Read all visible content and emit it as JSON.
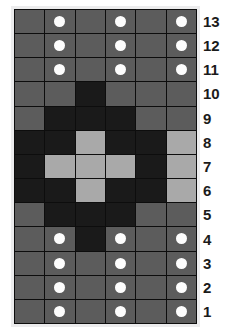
{
  "chart": {
    "columns": 6,
    "rows": 13,
    "colors": {
      "medium": "#5c5c5c",
      "dark": "#1a1a1a",
      "light": "#a9a9a9",
      "dot": "#fdfdfd",
      "gridline": "#0d0d0d",
      "frame": "#ececed",
      "label_text": "#1b1b1b",
      "background": "#ffffff"
    },
    "row_labels": [
      "13",
      "12",
      "11",
      "10",
      "9",
      "8",
      "7",
      "6",
      "5",
      "4",
      "3",
      "2",
      "1"
    ],
    "legend_symbols": {
      "dot": "white-dot",
      "medium": "medium-grey-square",
      "dark": "dark-square",
      "light": "light-grey-square"
    }
  },
  "chart_data": {
    "type": "heatmap",
    "xlabel": "",
    "ylabel": "",
    "categories": [
      "1",
      "2",
      "3",
      "4",
      "5",
      "6"
    ],
    "row_order_top_to_bottom": [
      "13",
      "12",
      "11",
      "10",
      "9",
      "8",
      "7",
      "6",
      "5",
      "4",
      "3",
      "2",
      "1"
    ],
    "value_legend": {
      "medium": "medium grey cell",
      "dark": "dark cell",
      "light": "light grey cell"
    },
    "grid": true,
    "legend_position": "none",
    "cells": [
      {
        "row": "13",
        "values": [
          "medium",
          "medium",
          "medium",
          "medium",
          "medium",
          "medium"
        ],
        "dots": [
          false,
          true,
          false,
          true,
          false,
          true
        ]
      },
      {
        "row": "12",
        "values": [
          "medium",
          "medium",
          "medium",
          "medium",
          "medium",
          "medium"
        ],
        "dots": [
          false,
          true,
          false,
          true,
          false,
          true
        ]
      },
      {
        "row": "11",
        "values": [
          "medium",
          "medium",
          "medium",
          "medium",
          "medium",
          "medium"
        ],
        "dots": [
          false,
          true,
          false,
          true,
          false,
          true
        ]
      },
      {
        "row": "10",
        "values": [
          "medium",
          "medium",
          "dark",
          "medium",
          "medium",
          "medium"
        ],
        "dots": [
          false,
          false,
          false,
          false,
          false,
          false
        ]
      },
      {
        "row": "9",
        "values": [
          "medium",
          "dark",
          "dark",
          "dark",
          "medium",
          "medium"
        ],
        "dots": [
          false,
          false,
          false,
          false,
          false,
          false
        ]
      },
      {
        "row": "8",
        "values": [
          "dark",
          "dark",
          "light",
          "dark",
          "dark",
          "light"
        ],
        "dots": [
          false,
          false,
          false,
          false,
          false,
          false
        ]
      },
      {
        "row": "7",
        "values": [
          "dark",
          "light",
          "light",
          "light",
          "dark",
          "light"
        ],
        "dots": [
          false,
          false,
          false,
          false,
          false,
          false
        ]
      },
      {
        "row": "6",
        "values": [
          "dark",
          "dark",
          "light",
          "dark",
          "dark",
          "light"
        ],
        "dots": [
          false,
          false,
          false,
          false,
          false,
          false
        ]
      },
      {
        "row": "5",
        "values": [
          "medium",
          "dark",
          "dark",
          "dark",
          "medium",
          "medium"
        ],
        "dots": [
          false,
          false,
          false,
          false,
          false,
          false
        ]
      },
      {
        "row": "4",
        "values": [
          "medium",
          "medium",
          "dark",
          "medium",
          "medium",
          "medium"
        ],
        "dots": [
          false,
          true,
          false,
          true,
          false,
          true
        ]
      },
      {
        "row": "3",
        "values": [
          "medium",
          "medium",
          "medium",
          "medium",
          "medium",
          "medium"
        ],
        "dots": [
          false,
          true,
          false,
          true,
          false,
          true
        ]
      },
      {
        "row": "2",
        "values": [
          "medium",
          "medium",
          "medium",
          "medium",
          "medium",
          "medium"
        ],
        "dots": [
          false,
          true,
          false,
          true,
          false,
          true
        ]
      },
      {
        "row": "1",
        "values": [
          "medium",
          "medium",
          "medium",
          "medium",
          "medium",
          "medium"
        ],
        "dots": [
          false,
          true,
          false,
          true,
          false,
          true
        ]
      }
    ]
  }
}
